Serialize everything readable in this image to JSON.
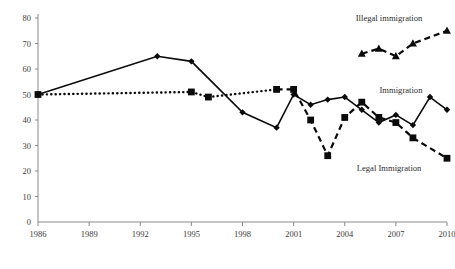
{
  "chart_data": {
    "type": "line",
    "title": "",
    "xlabel": "",
    "ylabel": "",
    "xlim": [
      1986,
      2010
    ],
    "ylim": [
      0,
      80
    ],
    "grid": false,
    "legend_position": "inline-right",
    "x_ticks": [
      "1986",
      "1989",
      "1992",
      "1995",
      "1998",
      "2001",
      "2004",
      "2007",
      "2010"
    ],
    "y_ticks": [
      "0",
      "10",
      "20",
      "30",
      "40",
      "50",
      "60",
      "70",
      "80"
    ],
    "series": [
      {
        "name": "Immigration",
        "marker": "diamond",
        "line_style": "solid",
        "label": "Immigration",
        "x": [
          1986,
          1993,
          1995,
          1998,
          2000,
          2001,
          2002,
          2003,
          2004,
          2005,
          2006,
          2007,
          2008,
          2009,
          2010
        ],
        "values": [
          50,
          65,
          63,
          43,
          37,
          50,
          46,
          48,
          49,
          44,
          39,
          42,
          38,
          49,
          44
        ]
      },
      {
        "name": "Legal Immigration",
        "marker": "square",
        "line_style": "dotted-then-dashed",
        "label": "Legal Immigration",
        "x": [
          1986,
          1995,
          1996,
          2000,
          2001,
          2002,
          2003,
          2004,
          2005,
          2006,
          2007,
          2008,
          2010
        ],
        "values": [
          50,
          51,
          49,
          52,
          52,
          40,
          26,
          41,
          47,
          41,
          39,
          33,
          25
        ]
      },
      {
        "name": "Illegal immigration",
        "marker": "triangle",
        "line_style": "dashed",
        "label": "Illegal immigration",
        "x": [
          2005,
          2006,
          2007,
          2008,
          2010
        ],
        "values": [
          66,
          68,
          65,
          70,
          75
        ]
      }
    ],
    "annotations": [
      {
        "text": "Illegal immigration",
        "x": 2006.6,
        "y": 79
      },
      {
        "text": "Immigration",
        "x": 2007.3,
        "y": 50.5
      },
      {
        "text": "Legal Immigration",
        "x": 2006.6,
        "y": 20
      }
    ]
  }
}
